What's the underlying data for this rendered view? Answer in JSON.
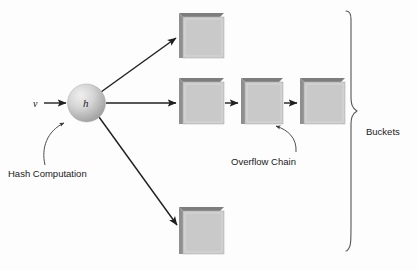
{
  "figure": {
    "type": "diagram",
    "background_color": "#fdfdfd"
  },
  "labels": {
    "input_value": "v",
    "hash_function": "h",
    "hash_computation": "Hash Computation",
    "overflow_chain": "Overflow Chain",
    "buckets": "Buckets"
  },
  "colors": {
    "box_face": "#c9c9c9",
    "box_left_shade": "#8f8f8f",
    "box_top_shade": "#7d7d7d",
    "line": "#1f1f1f",
    "brace": "#555555",
    "text": "#1a1a1a",
    "sphere_light": "#e8e8e8",
    "sphere_dark": "#9a9a9a"
  },
  "nodes": {
    "hash_sphere": {
      "cx": 86.5,
      "cy": 103,
      "r": 19
    },
    "buckets": [
      {
        "id": "bucket-top",
        "x": 179,
        "y": 13,
        "w": 45,
        "h": 45
      },
      {
        "id": "bucket-middle",
        "x": 179,
        "y": 78,
        "w": 45,
        "h": 46
      },
      {
        "id": "overflow-1",
        "x": 241,
        "y": 78,
        "w": 42,
        "h": 46
      },
      {
        "id": "overflow-2",
        "x": 300,
        "y": 78,
        "w": 45,
        "h": 46
      },
      {
        "id": "bucket-bottom",
        "x": 179,
        "y": 207,
        "w": 45,
        "h": 47
      }
    ]
  },
  "edges": [
    {
      "id": "input-to-hash",
      "from": "v",
      "to": "hash-sphere"
    },
    {
      "id": "hash-to-bucket-top",
      "from": "hash-sphere",
      "to": "bucket-top"
    },
    {
      "id": "hash-to-bucket-middle",
      "from": "hash-sphere",
      "to": "bucket-middle"
    },
    {
      "id": "hash-to-bucket-bottom",
      "from": "hash-sphere",
      "to": "bucket-bottom"
    },
    {
      "id": "bucket-middle-to-ov1",
      "from": "bucket-middle",
      "to": "overflow-1"
    },
    {
      "id": "ov1-to-ov2",
      "from": "overflow-1",
      "to": "overflow-2"
    }
  ],
  "annotations": [
    {
      "id": "hash-computation-callout",
      "label": "Hash Computation",
      "points_to": "hash-sphere"
    },
    {
      "id": "overflow-chain-callout",
      "label": "Overflow Chain",
      "points_to": "overflow-1"
    }
  ],
  "brace": {
    "id": "buckets-brace",
    "orientation": "left-pointing-right",
    "top": 11,
    "bottom": 251,
    "x": 346,
    "label": "Buckets"
  }
}
